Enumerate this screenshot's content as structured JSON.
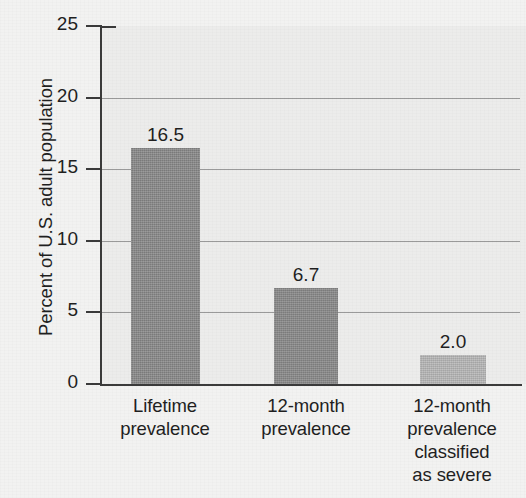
{
  "cutoff": {
    "text": "severe"
  },
  "chart_data": {
    "type": "bar",
    "title": "",
    "subtitle": "",
    "xlabel": "",
    "ylabel": "Percent of U.S. adult population",
    "ylim": [
      0,
      25
    ],
    "yticks": [
      "0",
      "5",
      "10",
      "15",
      "20",
      "25"
    ],
    "grid": true,
    "gridlines_at": [
      5,
      10,
      15,
      20
    ],
    "legend": "none",
    "categories": [
      "Lifetime prevalence",
      "12-month prevalence",
      "12-month prevalence classified as severe"
    ],
    "category_lines": [
      [
        "Lifetime",
        "prevalence"
      ],
      [
        "12-month",
        "prevalence"
      ],
      [
        "12-month",
        "prevalence",
        "classified",
        "as severe"
      ]
    ],
    "values": [
      16.5,
      6.7,
      2.0
    ],
    "value_labels": [
      "16.5",
      "6.7",
      "2.0"
    ],
    "bar_colors": [
      "#878787",
      "#878787",
      "#b5b5b5"
    ],
    "plot_background": "#ececeb",
    "axis_color": "#3a3a3a",
    "gridline_color": "#9a9a9a",
    "text_color": "#1f1f1f"
  }
}
